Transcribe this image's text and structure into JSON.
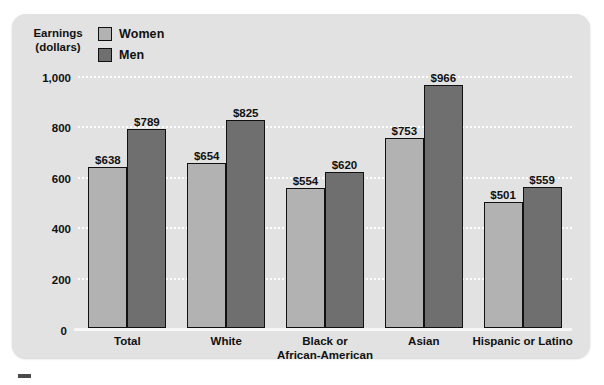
{
  "axis_title": {
    "line1": "Earnings",
    "line2": "(dollars)"
  },
  "legend": {
    "items": [
      {
        "label": "Women",
        "color": "#b2b2b2",
        "key": "women"
      },
      {
        "label": "Men",
        "color": "#6f6f6f",
        "key": "men"
      }
    ]
  },
  "chart_data": {
    "type": "bar",
    "title": "",
    "subtitle": "",
    "xlabel": "",
    "ylabel": "Earnings (dollars)",
    "ylim": [
      0,
      1000
    ],
    "yticks": [
      0,
      200,
      400,
      600,
      800,
      1000
    ],
    "ytick_labels": [
      "0",
      "200",
      "400",
      "600",
      "800",
      "1,000"
    ],
    "grid": true,
    "grid_style": "dotted-white-horizontal",
    "legend_position": "top-left",
    "categories": [
      "Total",
      "White",
      "Black or\nAfrican-American",
      "Asian",
      "Hispanic or Latino"
    ],
    "category_labels": [
      {
        "line1": "Total",
        "line2": ""
      },
      {
        "line1": "White",
        "line2": ""
      },
      {
        "line1": "Black or",
        "line2": "African-American"
      },
      {
        "line1": "Asian",
        "line2": ""
      },
      {
        "line1": "Hispanic or Latino",
        "line2": ""
      }
    ],
    "series": [
      {
        "name": "Women",
        "color": "#b2b2b2",
        "values": [
          638,
          654,
          554,
          753,
          501
        ],
        "labels": [
          "$638",
          "$654",
          "$554",
          "$753",
          "$501"
        ]
      },
      {
        "name": "Men",
        "color": "#6f6f6f",
        "values": [
          789,
          825,
          620,
          966,
          559
        ],
        "labels": [
          "$789",
          "$825",
          "$620",
          "$966",
          "$559"
        ]
      }
    ]
  },
  "colors": {
    "panel_background": "#e2e2e2",
    "page_background": "#ffffff",
    "gridline": "#ffffff",
    "text": "#111111",
    "bar_outline": "#111111"
  }
}
